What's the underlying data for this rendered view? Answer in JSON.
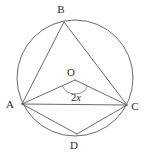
{
  "figure": {
    "kind": "circle-geometry-diagram",
    "background_color": "#ffffff",
    "stroke_color": "#5a5a5a",
    "label_color": "#2b2b2b",
    "circle": {
      "cx": 75,
      "cy": 78,
      "r": 58
    },
    "points": [
      {
        "id": "A",
        "label": "A",
        "x": 22,
        "y": 104,
        "label_x": 10,
        "label_y": 108
      },
      {
        "id": "B",
        "label": "B",
        "x": 64,
        "y": 22,
        "label_x": 61,
        "label_y": 13
      },
      {
        "id": "C",
        "label": "C",
        "x": 127,
        "y": 105,
        "label_x": 135,
        "label_y": 110
      },
      {
        "id": "D",
        "label": "D",
        "x": 77,
        "y": 134,
        "label_x": 74,
        "label_y": 149
      },
      {
        "id": "O",
        "label": "O",
        "x": 75,
        "y": 80,
        "label_x": 71,
        "label_y": 76
      }
    ],
    "segments": [
      {
        "from": "A",
        "to": "B"
      },
      {
        "from": "B",
        "to": "C"
      },
      {
        "from": "A",
        "to": "C"
      },
      {
        "from": "A",
        "to": "D"
      },
      {
        "from": "D",
        "to": "C"
      },
      {
        "from": "O",
        "to": "A"
      },
      {
        "from": "O",
        "to": "C"
      }
    ],
    "angle_mark": {
      "at": "O",
      "label_prefix": "2",
      "label_variable": "x",
      "label_x": 76,
      "label_y": 101,
      "arc_radius": 14
    }
  }
}
